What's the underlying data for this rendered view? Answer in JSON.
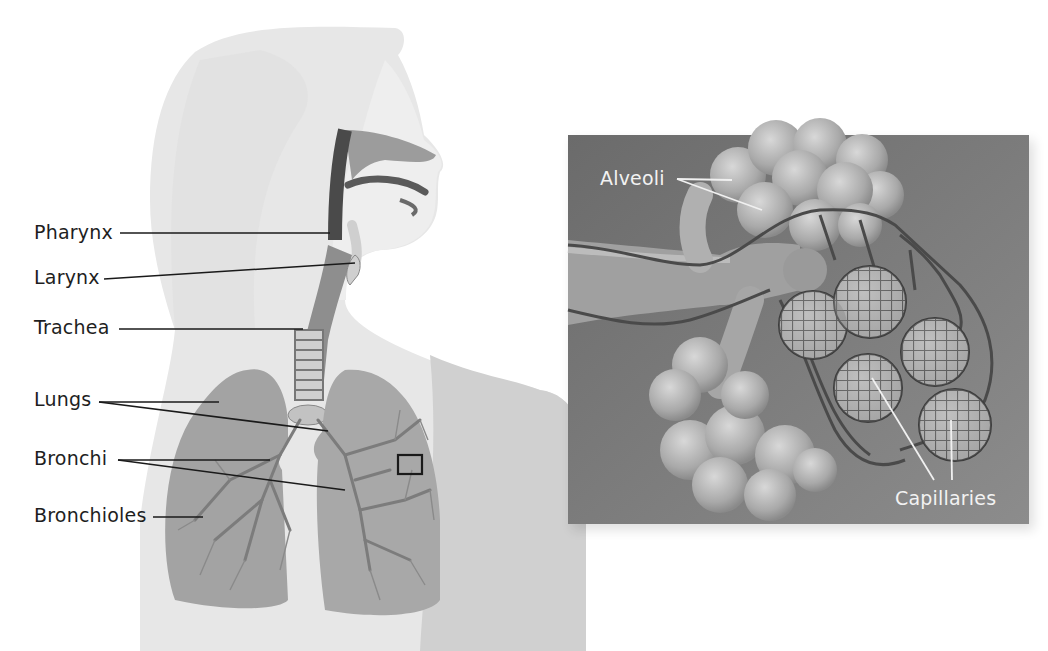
{
  "figure": {
    "title_cut": "",
    "left_labels": [
      {
        "id": "pharynx",
        "text": "Pharynx"
      },
      {
        "id": "larynx",
        "text": "Larynx"
      },
      {
        "id": "trachea",
        "text": "Trachea"
      },
      {
        "id": "lungs",
        "text": "Lungs"
      },
      {
        "id": "bronchi",
        "text": "Bronchi"
      },
      {
        "id": "bronchioles",
        "text": "Bronchioles"
      }
    ],
    "inset": {
      "labels": [
        {
          "id": "alveoli",
          "text": "Alveoli"
        },
        {
          "id": "capillaries",
          "text": "Capillaries"
        }
      ],
      "background_color": "#7a7a7a"
    },
    "colors": {
      "body_silhouette": "#e6e6e6",
      "lung_fill": "#9a9a9a",
      "leader_line_dark": "#1a1a1a",
      "leader_line_light": "#f0f0f0"
    }
  }
}
